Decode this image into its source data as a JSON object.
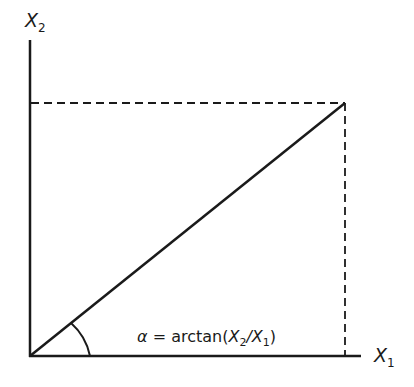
{
  "diagram": {
    "y_axis_label": {
      "main": "X",
      "sub": "2"
    },
    "x_axis_label": {
      "main": "X",
      "sub": "1"
    },
    "angle_formula": {
      "symbol": "α",
      "equals": " = ",
      "func": "arctan(",
      "num_main": "X",
      "num_sub": "2",
      "slash": "/",
      "den_main": "X",
      "den_sub": "1",
      "close": ")"
    },
    "colors": {
      "line": "#1a1a1a",
      "background": "#ffffff"
    }
  }
}
